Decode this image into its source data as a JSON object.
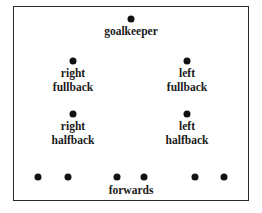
{
  "diagram": {
    "title": "",
    "positions": [
      {
        "id": "goalkeeper",
        "label": [
          "goalkeeper"
        ],
        "dot": [
          131,
          19
        ],
        "label_pos": [
          131,
          24
        ]
      },
      {
        "id": "right-fullback",
        "label": [
          "right",
          "fullback"
        ],
        "dot": [
          73,
          61
        ],
        "label_pos": [
          73,
          66
        ]
      },
      {
        "id": "left-fullback",
        "label": [
          "left",
          "fullback"
        ],
        "dot": [
          187,
          61
        ],
        "label_pos": [
          187,
          66
        ]
      },
      {
        "id": "right-halfback",
        "label": [
          "right",
          "halfback"
        ],
        "dot": [
          73,
          114
        ],
        "label_pos": [
          73,
          119
        ]
      },
      {
        "id": "left-halfback",
        "label": [
          "left",
          "halfback"
        ],
        "dot": [
          187,
          114
        ],
        "label_pos": [
          187,
          119
        ]
      }
    ],
    "forwards": {
      "label": "forwards",
      "dots": [
        [
          38,
          177
        ],
        [
          68,
          177
        ],
        [
          117,
          177
        ],
        [
          144,
          177
        ],
        [
          195,
          177
        ],
        [
          224,
          177
        ]
      ],
      "label_pos": [
        131,
        183
      ]
    }
  }
}
